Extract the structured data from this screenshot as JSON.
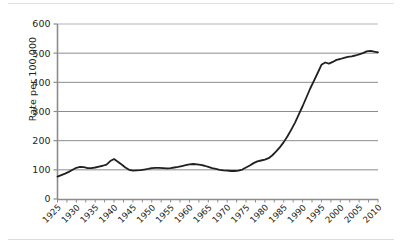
{
  "chart_data": {
    "type": "line",
    "title": "",
    "subtitle": "",
    "xlabel": "",
    "ylabel": "Rate per 100,000",
    "xlim": [
      1925,
      2010
    ],
    "ylim": [
      0,
      600
    ],
    "yticks": [
      0,
      100,
      200,
      300,
      400,
      500,
      600
    ],
    "ytick_labels": [
      "0",
      "100",
      "200",
      "300",
      "400",
      "500",
      "600"
    ],
    "xticks": [
      1925,
      1930,
      1935,
      1940,
      1945,
      1950,
      1955,
      1960,
      1965,
      1970,
      1975,
      1980,
      1985,
      1990,
      1995,
      2000,
      2005,
      2010
    ],
    "xtick_labels": [
      "1925",
      "1930",
      "1935",
      "1940",
      "1945",
      "1950",
      "1955",
      "1960",
      "1965",
      "1970",
      "1975",
      "1980",
      "1985",
      "1990",
      "1995",
      "2000",
      "2005",
      "2010"
    ],
    "grid": "horizontal",
    "legend": "none",
    "line_color": "#231f20",
    "line_width": 1.8,
    "series": [
      {
        "name": "Rate per 100,000",
        "x": [
          1925,
          1926,
          1927,
          1928,
          1929,
          1930,
          1931,
          1932,
          1933,
          1934,
          1935,
          1936,
          1937,
          1938,
          1939,
          1940,
          1941,
          1942,
          1943,
          1944,
          1945,
          1946,
          1947,
          1948,
          1949,
          1950,
          1951,
          1952,
          1953,
          1954,
          1955,
          1956,
          1957,
          1958,
          1959,
          1960,
          1961,
          1962,
          1963,
          1964,
          1965,
          1966,
          1967,
          1968,
          1969,
          1970,
          1971,
          1972,
          1973,
          1974,
          1975,
          1976,
          1977,
          1978,
          1979,
          1980,
          1981,
          1982,
          1983,
          1984,
          1985,
          1986,
          1987,
          1988,
          1989,
          1990,
          1991,
          1992,
          1993,
          1994,
          1995,
          1996,
          1997,
          1998,
          1999,
          2000,
          2001,
          2002,
          2003,
          2004,
          2005,
          2006,
          2007,
          2008,
          2009,
          2010
        ],
        "values": [
          77,
          82,
          87,
          93,
          100,
          107,
          110,
          109,
          106,
          106,
          108,
          111,
          114,
          118,
          130,
          137,
          128,
          118,
          108,
          100,
          97,
          98,
          99,
          101,
          103,
          106,
          107,
          107,
          106,
          105,
          106,
          108,
          110,
          113,
          116,
          119,
          120,
          119,
          117,
          114,
          110,
          106,
          103,
          100,
          98,
          97,
          96,
          96,
          97,
          101,
          108,
          115,
          123,
          129,
          132,
          135,
          140,
          150,
          163,
          178,
          195,
          215,
          238,
          262,
          290,
          318,
          348,
          378,
          405,
          432,
          460,
          468,
          464,
          470,
          477,
          480,
          484,
          487,
          489,
          492,
          496,
          500,
          506,
          508,
          505,
          503
        ]
      }
    ]
  }
}
